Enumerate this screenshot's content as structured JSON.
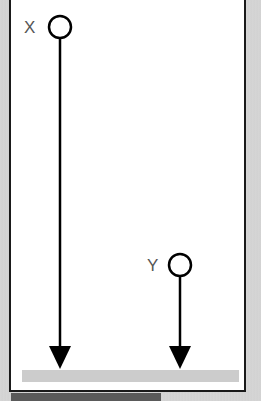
{
  "diagram": {
    "objects": [
      {
        "label": "X",
        "cx": 60,
        "cy": 27,
        "r": 11,
        "arrow_end_y": 368
      },
      {
        "label": "Y",
        "cx": 180,
        "cy": 265,
        "r": 11,
        "arrow_end_y": 368
      }
    ],
    "ground": {
      "label": "",
      "color": "#cccccc"
    },
    "colors": {
      "line": "#000000",
      "panel": "#ffffff",
      "frame": "#1a1a1a",
      "background": "#d4d4d4",
      "label_text": "#555555"
    }
  }
}
